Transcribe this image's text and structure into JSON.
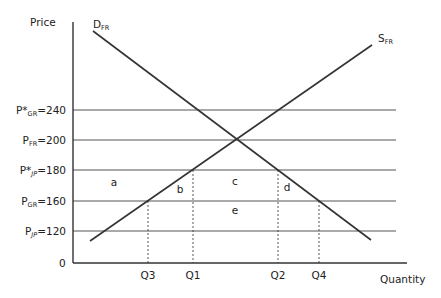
{
  "diagram": {
    "title": "",
    "y_axis_label": "Price",
    "x_axis_label": "Quantity",
    "origin_label": "0",
    "colors": {
      "axis": "#333333",
      "curve": "#333333",
      "price_line": "#555555",
      "dashed": "#444444",
      "text": "#222222"
    },
    "curves": [
      {
        "id": "demand",
        "label_main": "D",
        "label_sub": "FR"
      },
      {
        "id": "supply",
        "label_main": "S",
        "label_sub": "FR"
      }
    ],
    "price_lines": [
      {
        "label_main": "P*",
        "label_sub": "GR",
        "value": "240",
        "text": "=240"
      },
      {
        "label_main": "P",
        "label_sub": "FR",
        "value": "200",
        "text": "=200"
      },
      {
        "label_main": "P*",
        "label_sub": "JP",
        "value": "180",
        "text": "=180"
      },
      {
        "label_main": "P",
        "label_sub": "GR",
        "value": "160",
        "text": "=160"
      },
      {
        "label_main": "P",
        "label_sub": "JP",
        "value": "120",
        "text": "=120"
      }
    ],
    "quantity_marks": [
      {
        "label": "Q3"
      },
      {
        "label": "Q1"
      },
      {
        "label": "Q2"
      },
      {
        "label": "Q4"
      }
    ],
    "areas": [
      {
        "label": "a"
      },
      {
        "label": "b"
      },
      {
        "label": "c"
      },
      {
        "label": "d"
      },
      {
        "label": "e"
      }
    ]
  }
}
